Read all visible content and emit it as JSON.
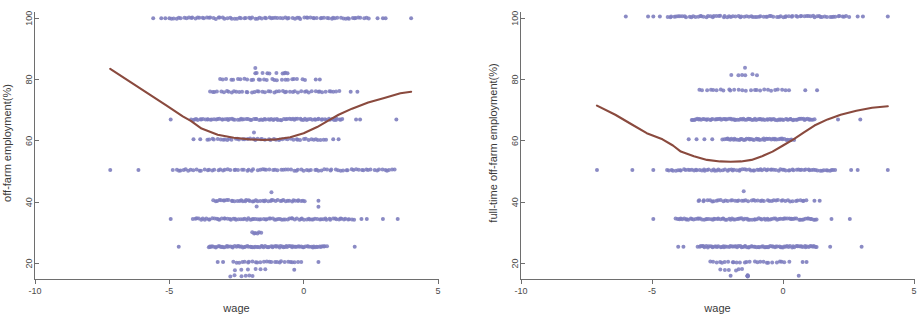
{
  "figure": {
    "background_color": "#ffffff",
    "point_color": "#7d7dbe",
    "curve_color": "#8a4a3e",
    "axis_color": "#6e6e6e",
    "panel_count": 2
  },
  "chart_data": [
    {
      "type": "scatter",
      "panel": "left",
      "title": "",
      "xlabel": "wage",
      "ylabel": "off-farm employment(%)",
      "xlim": [
        -10,
        5
      ],
      "ylim": [
        14,
        102
      ],
      "xticks": [
        -10,
        -5,
        0,
        5
      ],
      "xticklabels": [
        "-10",
        "-5",
        "0",
        "5"
      ],
      "yticks": [
        20,
        40,
        60,
        80,
        100
      ],
      "yticklabels": [
        "20",
        "40",
        "60",
        "80",
        "100"
      ],
      "grid": false,
      "legend": "none",
      "series": [
        {
          "name": "observations",
          "kind": "scatter",
          "color": "#7d7dbe",
          "marker": "circle",
          "note": "discrete employment-share bands; dense horizontal clusters",
          "bands": [
            {
              "y": 100,
              "x_start": -4.9,
              "x_end": 2.4,
              "density": "very-high",
              "outliers_x": [
                -5.6,
                -5.3,
                -5.15,
                -5.0,
                2.75,
                2.95,
                3.05,
                4.0
              ]
            },
            {
              "y": 83.5,
              "x_start": -1.8,
              "x_end": -1.8,
              "density": "single"
            },
            {
              "y": 82.0,
              "x_start": -1.8,
              "x_end": -0.6,
              "density": "sparse",
              "outliers_x": [
                -1.8,
                -1.35,
                -0.72,
                -0.6
              ]
            },
            {
              "y": 80.0,
              "x_start": -3.1,
              "x_end": 0.05,
              "density": "medium",
              "outliers_x": [
                0.45,
                0.6
              ]
            },
            {
              "y": 76.0,
              "x_start": -3.5,
              "x_end": 1.35,
              "density": "high",
              "outliers_x": [
                1.75,
                2.0
              ]
            },
            {
              "y": 67.0,
              "x_start": -4.2,
              "x_end": 1.45,
              "density": "very-high",
              "outliers_x": [
                -4.95,
                1.95,
                2.1,
                3.45
              ]
            },
            {
              "y": 62.5,
              "x_start": -1.85,
              "x_end": -1.85,
              "density": "single"
            },
            {
              "y": 60.5,
              "x_start": -3.6,
              "x_end": 0.85,
              "density": "high",
              "outliers_x": [
                -4.1,
                -3.85,
                1.1,
                1.3
              ]
            },
            {
              "y": 50.5,
              "x_start": -4.85,
              "x_end": 3.4,
              "density": "very-high",
              "outliers_x": [
                -7.2,
                -6.15
              ]
            },
            {
              "y": 43.0,
              "x_start": -1.2,
              "x_end": -1.2,
              "density": "single"
            },
            {
              "y": 40.5,
              "x_start": -3.35,
              "x_end": 0.05,
              "density": "high",
              "outliers_x": [
                0.55
              ]
            },
            {
              "y": 38.5,
              "x_start": -1.75,
              "x_end": -1.75,
              "density": "single",
              "outliers_x": [
                0.55
              ]
            },
            {
              "y": 34.5,
              "x_start": -4.1,
              "x_end": 1.85,
              "density": "very-high",
              "outliers_x": [
                -4.95,
                2.15,
                2.35,
                2.95,
                3.5
              ]
            },
            {
              "y": 30.0,
              "x_start": -1.9,
              "x_end": -1.6,
              "density": "sparse"
            },
            {
              "y": 25.5,
              "x_start": -3.55,
              "x_end": 0.85,
              "density": "very-high",
              "outliers_x": [
                -4.65,
                1.9
              ]
            },
            {
              "y": 20.5,
              "x_start": -2.6,
              "x_end": -0.1,
              "density": "medium",
              "outliers_x": [
                -3.2,
                -3.0,
                0.55
              ]
            },
            {
              "y": 18.0,
              "x_start": -2.5,
              "x_end": -1.4,
              "density": "sparse",
              "outliers_x": [
                -0.35
              ]
            },
            {
              "y": 16.0,
              "x_start": -2.7,
              "x_end": -1.85,
              "density": "sparse"
            }
          ]
        },
        {
          "name": "lowess fit",
          "kind": "line",
          "color": "#8a4a3e",
          "x": [
            -7.2,
            -6.5,
            -5.8,
            -5.1,
            -4.5,
            -4.2,
            -3.8,
            -3.2,
            -2.6,
            -2.0,
            -1.5,
            -1.0,
            -0.5,
            0.0,
            0.5,
            0.9,
            1.3,
            1.8,
            2.4,
            3.0,
            3.6,
            4.0
          ],
          "y": [
            83.5,
            79.5,
            75.5,
            71.5,
            68.0,
            66.5,
            64.0,
            62.0,
            61.0,
            60.5,
            60.3,
            60.5,
            61.2,
            62.5,
            64.5,
            66.5,
            68.5,
            70.5,
            72.5,
            74.0,
            75.5,
            76.0
          ]
        }
      ]
    },
    {
      "type": "scatter",
      "panel": "right",
      "title": "",
      "xlabel": "wage",
      "ylabel": "full-time off-farm employment(%)",
      "xlim": [
        -10,
        5
      ],
      "ylim": [
        14,
        102
      ],
      "xticks": [
        -10,
        -5,
        0,
        5
      ],
      "xticklabels": [
        "-10",
        "-5",
        "0",
        "5"
      ],
      "yticks": [
        20,
        40,
        60,
        80,
        100
      ],
      "yticklabels": [
        "20",
        "40",
        "60",
        "80",
        "100"
      ],
      "grid": false,
      "legend": "none",
      "series": [
        {
          "name": "observations",
          "kind": "scatter",
          "color": "#7d7dbe",
          "marker": "circle",
          "note": "discrete employment-share bands; dense horizontal clusters",
          "bands": [
            {
              "y": 100.5,
              "x_start": -4.4,
              "x_end": 2.5,
              "density": "very-high",
              "outliers_x": [
                -6.0,
                -5.15,
                -4.95,
                -4.7,
                2.85,
                3.05,
                4.0
              ]
            },
            {
              "y": 84.0,
              "x_start": -1.45,
              "x_end": -1.45,
              "density": "single"
            },
            {
              "y": 81.5,
              "x_start": -1.95,
              "x_end": -1.0,
              "density": "sparse"
            },
            {
              "y": 76.5,
              "x_start": -3.2,
              "x_end": 0.25,
              "density": "medium",
              "outliers_x": [
                0.85,
                1.3
              ]
            },
            {
              "y": 67.0,
              "x_start": -3.5,
              "x_end": 1.2,
              "density": "very-high",
              "outliers_x": [
                2.1,
                2.95
              ]
            },
            {
              "y": 60.5,
              "x_start": -2.3,
              "x_end": 0.4,
              "density": "high",
              "outliers_x": [
                -3.6,
                -3.3,
                -3.0,
                -2.7
              ]
            },
            {
              "y": 50.5,
              "x_start": -4.4,
              "x_end": 2.0,
              "density": "very-high",
              "outliers_x": [
                -7.1,
                -5.75,
                -4.95,
                2.6,
                2.85,
                4.0
              ]
            },
            {
              "y": 43.5,
              "x_start": -1.5,
              "x_end": -1.5,
              "density": "single"
            },
            {
              "y": 40.5,
              "x_start": -3.25,
              "x_end": 0.9,
              "density": "high",
              "outliers_x": [
                1.2,
                1.4
              ]
            },
            {
              "y": 34.5,
              "x_start": -4.1,
              "x_end": 1.3,
              "density": "very-high",
              "outliers_x": [
                -4.95,
                1.85,
                2.55
              ]
            },
            {
              "y": 25.5,
              "x_start": -3.25,
              "x_end": 1.3,
              "density": "very-high",
              "outliers_x": [
                -4.0,
                -3.8,
                1.8,
                3.0
              ]
            },
            {
              "y": 20.5,
              "x_start": -2.8,
              "x_end": 0.2,
              "density": "medium",
              "outliers_x": [
                0.75,
                0.9
              ]
            },
            {
              "y": 18.0,
              "x_start": -2.4,
              "x_end": -1.5,
              "density": "sparse"
            },
            {
              "y": 16.0,
              "x_start": -1.35,
              "x_end": -1.35,
              "density": "sparse",
              "outliers_x": [
                -2.0,
                0.6
              ]
            }
          ]
        },
        {
          "name": "lowess fit",
          "kind": "line",
          "color": "#8a4a3e",
          "x": [
            -7.1,
            -6.4,
            -5.8,
            -5.2,
            -4.6,
            -4.2,
            -3.9,
            -3.4,
            -2.9,
            -2.4,
            -2.0,
            -1.6,
            -1.2,
            -0.8,
            -0.4,
            0.0,
            0.4,
            0.8,
            1.2,
            1.7,
            2.2,
            2.8,
            3.4,
            4.0
          ],
          "y": [
            71.5,
            68.5,
            65.5,
            62.5,
            60.5,
            58.5,
            56.5,
            55.0,
            53.8,
            53.3,
            53.2,
            53.3,
            53.8,
            55.0,
            56.5,
            58.5,
            60.5,
            62.8,
            65.0,
            67.0,
            68.5,
            69.8,
            70.8,
            71.3
          ]
        }
      ]
    }
  ]
}
